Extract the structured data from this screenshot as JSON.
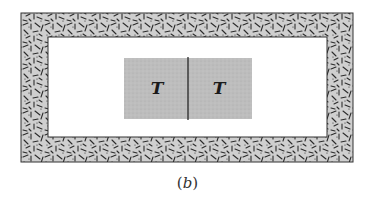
{
  "figure": {
    "caption_open": "(",
    "caption_letter": "b",
    "caption_close": ")",
    "blocks": [
      {
        "label": "T"
      },
      {
        "label": "T"
      }
    ],
    "colors": {
      "insulation_fill": "#c9c9c9",
      "insulation_hatch": "#2b2b2b",
      "block_fill": "#b8b8b8",
      "outline": "#333333",
      "interior": "#ffffff"
    }
  }
}
